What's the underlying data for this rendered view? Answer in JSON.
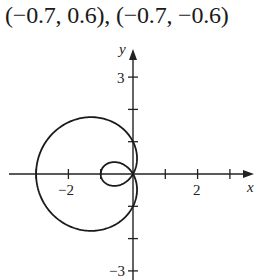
{
  "caption": "(−0.7, 0.6), (−0.7, −0.6)",
  "chart_data": {
    "type": "line",
    "plot": "polar curve (limaçon with inner loop)",
    "equation": "r = 1 - 2cos(theta)",
    "title": "(−0.7, 0.6), (−0.7, −0.6)",
    "xlabel": "x",
    "ylabel": "y",
    "x_ticks": [
      -3,
      -2,
      -1,
      1,
      2,
      3
    ],
    "x_tick_labels": [
      {
        "value": -2,
        "label": "−2"
      },
      {
        "value": 2,
        "label": "2"
      }
    ],
    "y_ticks": [
      -3,
      -2,
      -1,
      1,
      2,
      3
    ],
    "y_tick_labels": [
      {
        "value": 3,
        "label": "3"
      },
      {
        "value": -3,
        "label": "−3"
      }
    ],
    "xlim": [
      -3.8,
      3.7
    ],
    "ylim": [
      -3.2,
      3.8
    ],
    "grid": false,
    "key_points": [
      {
        "x": -3,
        "y": 0
      },
      {
        "x": -1,
        "y": 0
      },
      {
        "x": 0,
        "y": 1
      },
      {
        "x": 0,
        "y": -1
      },
      {
        "x": 0,
        "y": 0
      }
    ],
    "curve_color": "#1a1a1a"
  },
  "axes": {
    "x_label": "x",
    "y_label": "y",
    "x_tick_neg2": "−2",
    "x_tick_2": "2",
    "y_tick_3": "3",
    "y_tick_neg3": "−3"
  }
}
